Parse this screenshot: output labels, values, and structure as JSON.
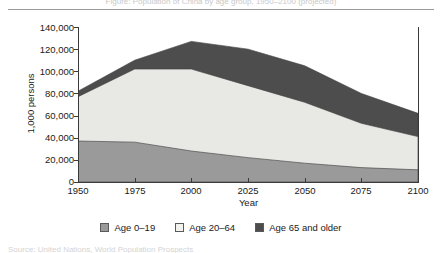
{
  "figure": {
    "caption_top_cropped": "Figure: Population of China by age group, 1950–2100 (projected)",
    "caption_bottom_cropped": "Source: United Nations, World Population Prospects",
    "ylabel": "1,000 persons",
    "xlabel": "Year"
  },
  "legend": {
    "items": [
      {
        "label": "Age 0–19",
        "color": "#9a9a9a",
        "name": "age-0-19"
      },
      {
        "label": "Age 20–64",
        "color": "#e8e8e4",
        "name": "age-20-64"
      },
      {
        "label": "Age 65 and older",
        "color": "#4d4d4d",
        "name": "age-65-plus"
      }
    ]
  },
  "axes": {
    "y_ticks": [
      "0",
      "20,000",
      "40,000",
      "60,000",
      "80,000",
      "100,000",
      "120,000",
      "140,000"
    ],
    "x_ticks": [
      "1950",
      "1975",
      "2000",
      "2025",
      "2050",
      "2075",
      "2100"
    ]
  },
  "chart_data": {
    "type": "area",
    "stacked": true,
    "title": "",
    "xlabel": "Year",
    "ylabel": "1,000 persons",
    "x": [
      1950,
      1975,
      2000,
      2025,
      2050,
      2075,
      2100
    ],
    "xlim": [
      1950,
      2100
    ],
    "ylim": [
      0,
      140000
    ],
    "y_tick_values": [
      0,
      20000,
      40000,
      60000,
      80000,
      100000,
      120000,
      140000
    ],
    "x_tick_values": [
      1950,
      1975,
      2000,
      2025,
      2050,
      2075,
      2100
    ],
    "grid": false,
    "legend_position": "bottom-center",
    "series": [
      {
        "name": "Age 0–19",
        "color": "#9a9a9a",
        "values": [
          37000,
          36000,
          28000,
          22000,
          17000,
          13000,
          11000
        ]
      },
      {
        "name": "Age 20–64",
        "color": "#e8e8e4",
        "values": [
          40000,
          66000,
          74000,
          65000,
          55000,
          40000,
          30000
        ]
      },
      {
        "name": "Age 65 and older",
        "color": "#4d4d4d",
        "values": [
          5000,
          8000,
          25000,
          33000,
          33000,
          27000,
          21000
        ]
      }
    ],
    "cumulative_tops": {
      "age_0_19": [
        37000,
        36000,
        28000,
        22000,
        17000,
        13000,
        11000
      ],
      "age_0_64": [
        77000,
        102000,
        102000,
        87000,
        72000,
        53000,
        41000
      ],
      "total": [
        82000,
        110000,
        127000,
        120000,
        105000,
        80000,
        62000
      ]
    }
  }
}
